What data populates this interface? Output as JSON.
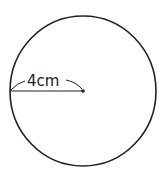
{
  "diagram": {
    "type": "circle-with-radius",
    "radius_label": "4cm",
    "colors": {
      "stroke": "#222222",
      "background": "#ffffff"
    },
    "geometry": {
      "center": [
        83,
        91
      ],
      "rx": 73,
      "ry": 75,
      "radius_line_end": [
        10,
        91
      ]
    }
  }
}
